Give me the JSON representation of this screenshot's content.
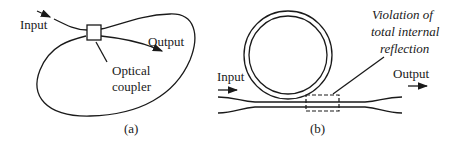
{
  "figure": {
    "panel_a": {
      "caption": "(a)",
      "labels": {
        "input": "Input",
        "output": "Output",
        "coupler_line1": "Optical",
        "coupler_line2": "coupler"
      }
    },
    "panel_b": {
      "caption": "(b)",
      "labels": {
        "input": "Input",
        "output": "Output",
        "annotation_line1": "Violation of",
        "annotation_line2": "total internal",
        "annotation_line3": "reflection"
      }
    },
    "colors": {
      "stroke": "#1a1a1a",
      "background": "#ffffff"
    }
  }
}
